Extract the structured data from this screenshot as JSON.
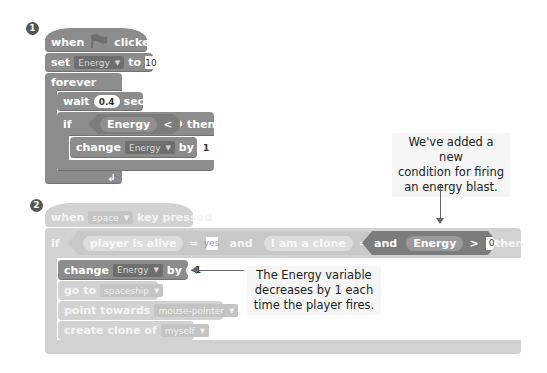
{
  "script1": {
    "badge": "1",
    "hat": {
      "when": "when",
      "flag_icon": "green-flag-icon",
      "clicked": "clicked"
    },
    "set_block": {
      "label": "set",
      "variable": "Energy",
      "to": "to",
      "value": "10"
    },
    "forever": {
      "label": "forever"
    },
    "wait_block": {
      "label": "wait",
      "value": "0.4",
      "unit": "secs"
    },
    "if_block": {
      "label": "if",
      "then": "then",
      "condition": {
        "left": "Energy",
        "op": "<",
        "right": "10"
      }
    },
    "change_block": {
      "label": "change",
      "variable": "Energy",
      "by": "by",
      "value": "1"
    },
    "loop_icon": "loop-arrow-icon"
  },
  "script2": {
    "badge": "2",
    "hat": {
      "when": "when",
      "key": "space",
      "pressed": "key pressed"
    },
    "if_block": {
      "label": "if",
      "then": "then",
      "conditions": [
        {
          "left": "player is alive",
          "op": "=",
          "right": "yes"
        },
        {
          "joiner": "and"
        },
        {
          "left": "I am a clone",
          "op": "=",
          "right": "no"
        },
        {
          "joiner": "and"
        },
        {
          "left": "Energy",
          "op": ">",
          "right": "0"
        }
      ]
    },
    "change_block": {
      "label": "change",
      "variable": "Energy",
      "by": "by",
      "value": "-1"
    },
    "goto_block": {
      "label": "go to",
      "target": "spaceship"
    },
    "point_block": {
      "label": "point towards",
      "target": "mouse-pointer"
    },
    "clone_block": {
      "label": "create clone of",
      "target": "myself"
    }
  },
  "annotations": {
    "top_note": "We've added a new condition for firing an energy blast.",
    "top_note_lines": [
      "We've added a new",
      "condition for firing",
      "an energy blast."
    ],
    "bottom_note": "The Energy variable decreases by 1 each time the player fires.",
    "bottom_note_lines": [
      "The Energy variable",
      "decreases by 1 each",
      "time the player fires."
    ]
  }
}
